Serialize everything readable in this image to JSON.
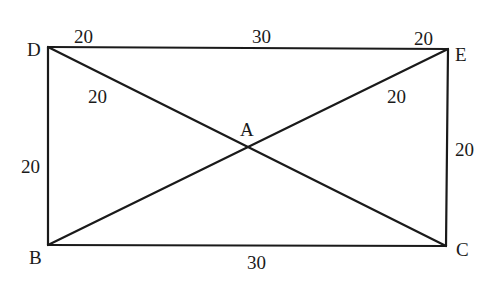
{
  "diagram": {
    "type": "geometry",
    "shape": "rectangle with diagonals",
    "points": {
      "D": {
        "label": "D",
        "x": 48,
        "y": 47
      },
      "E": {
        "label": "E",
        "x": 448,
        "y": 49
      },
      "B": {
        "label": "B",
        "x": 48,
        "y": 245
      },
      "C": {
        "label": "C",
        "x": 446,
        "y": 246
      },
      "A": {
        "label": "A",
        "x": 247,
        "y": 148
      }
    },
    "edges": [
      {
        "from": "D",
        "to": "E"
      },
      {
        "from": "E",
        "to": "C"
      },
      {
        "from": "C",
        "to": "B"
      },
      {
        "from": "B",
        "to": "D"
      },
      {
        "from": "D",
        "to": "C"
      },
      {
        "from": "B",
        "to": "E"
      }
    ],
    "measurements": {
      "top_left": "20",
      "top_middle": "30",
      "top_right": "20",
      "diag_left": "20",
      "diag_right": "20",
      "left_side": "20",
      "right_side": "20",
      "bottom": "30"
    }
  }
}
